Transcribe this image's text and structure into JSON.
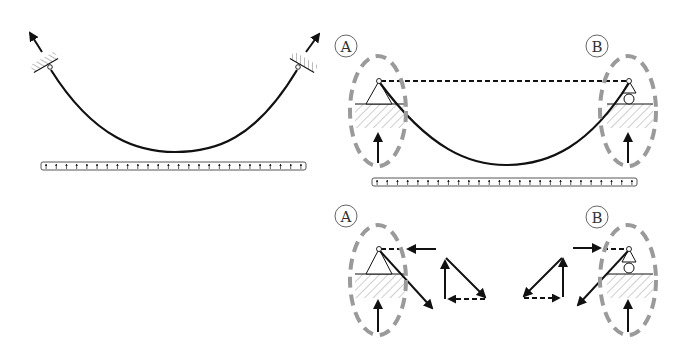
{
  "diagram": {
    "type": "statics free-body diagram of suspended cable under uniform load",
    "colors": {
      "line": "#111111",
      "support_ellipse": "#9a9a9a",
      "hatch": "#999999",
      "background": "#ffffff"
    },
    "panels": [
      {
        "id": "left-fixed-anchors",
        "description": "Cable hanging between two inclined fixed anchors, tension arrows along cable direction, uniform distributed load bar below"
      },
      {
        "id": "top-right-pin-roller",
        "description": "Cable between pin support A and roller support B, dashed chord line, vertical reaction arrows, supports circled by dashed ellipses, uniform load bar below",
        "labels": [
          "A",
          "B"
        ]
      },
      {
        "id": "bottom-right-force-triangles",
        "description": "Free-body details at supports A and B with horizontal and inclined force components and their vector triangles",
        "labels": [
          "A",
          "B"
        ]
      }
    ],
    "labels": {
      "support_a_top": "A",
      "support_b_top": "B",
      "support_a_bottom": "A",
      "support_b_bottom": "B"
    },
    "load_bars": [
      {
        "panel": "left",
        "arrow_count": 26
      },
      {
        "panel": "top-right",
        "arrow_count": 26
      }
    ]
  }
}
